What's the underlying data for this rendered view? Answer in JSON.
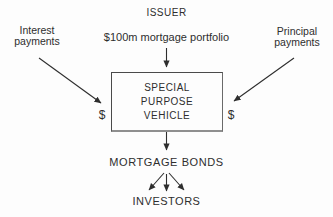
{
  "diagram": {
    "issuer": "ISSUER",
    "portfolio": "$100m mortgage portfolio",
    "interest": "Interest\npayments",
    "principal": "Principal\npayments",
    "spv": "SPECIAL\nPURPOSE\nVEHICLE",
    "dollar_left": "$",
    "dollar_right": "$",
    "mortgage_bonds": "MORTGAGE BONDS",
    "investors": "INVESTORS",
    "colors": {
      "background": "#fdfdfd",
      "text": "#2e2e2e",
      "line": "#2e2e2e",
      "box_border": "#4a4a4a"
    }
  }
}
